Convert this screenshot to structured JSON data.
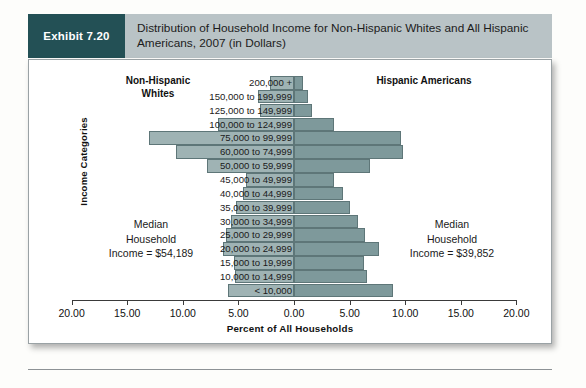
{
  "header": {
    "badge": "Exhibit 7.20",
    "title": "Distribution of Household Income for Non-Hispanic Whites and All Hispanic Americans, 2007 (in Dollars)"
  },
  "chart_data": {
    "type": "bar",
    "orientation": "population-pyramid",
    "title": "Distribution of Household Income for Non-Hispanic Whites and All Hispanic Americans, 2007 (in Dollars)",
    "xlabel": "Percent of All Households",
    "ylabel": "Income Categories",
    "xlim": [
      -20,
      20
    ],
    "xticks": [
      -20,
      -15,
      -10,
      -5,
      0,
      5,
      10,
      15,
      20
    ],
    "xticklabels": [
      "20.00",
      "15.00",
      "10.00",
      "5.00",
      "0.00",
      "5.00",
      "10.00",
      "15.00",
      "20.00"
    ],
    "grid": false,
    "legend": "none",
    "left_group_label": "Non-Hispanic\nWhites",
    "right_group_label": "Hispanic Americans",
    "categories": [
      "200,000 +",
      "150,000 to 199,999",
      "125,000 to 149,999",
      "100,000 to 124,999",
      "75,000 to 99,999",
      "60,000 to 74,999",
      "50,000 to 59,999",
      "45,000 to 49,999",
      "40,000 to 44,999",
      "35,000 to 39,999",
      "30,000 to 34,999",
      "25,000 to 29,999",
      "20,000 to 24,999",
      "15,000 to 19,999",
      "10,000 to 14,999",
      "< 10,000"
    ],
    "series": [
      {
        "name": "Non-Hispanic Whites",
        "side": "left",
        "values": [
          2.2,
          3.2,
          3.1,
          6.8,
          13.0,
          10.6,
          7.8,
          4.3,
          4.6,
          5.2,
          5.7,
          6.1,
          6.4,
          5.4,
          5.3,
          5.9
        ]
      },
      {
        "name": "Hispanic Americans",
        "side": "right",
        "values": [
          0.8,
          1.3,
          1.6,
          3.6,
          9.6,
          9.8,
          6.8,
          3.6,
          4.4,
          5.0,
          5.8,
          6.4,
          7.6,
          6.3,
          6.6,
          8.9
        ]
      }
    ],
    "annotations": [
      {
        "text": "Median Household Income = $54,189",
        "group": "Non-Hispanic Whites"
      },
      {
        "text": "Median Household Income = $39,852",
        "group": "Hispanic Americans"
      }
    ]
  },
  "annotations": {
    "left": {
      "line1": "Median",
      "line2": "Household",
      "line3": "Income = $54,189"
    },
    "right": {
      "line1": "Median",
      "line2": "Household",
      "line3": "Income = $39,852"
    }
  },
  "groups": {
    "left_line1": "Non-Hispanic",
    "left_line2": "Whites",
    "right": "Hispanic Americans"
  }
}
